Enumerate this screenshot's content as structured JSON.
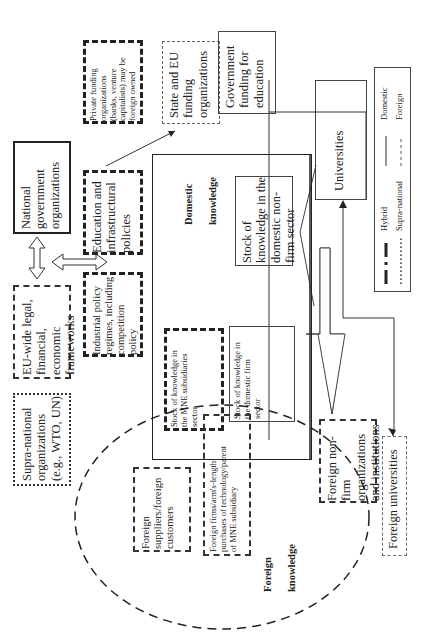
{
  "diagram": {
    "orientation": "rotated-90-ccw",
    "nodes": {
      "private_funding": "Private funding\norganizations\n(banks, venture\ncapitalists) may be\nforeign owned",
      "state_eu_funding": "State and EU\nfunding\norganizations",
      "gov_funding_education": "Government\nfunding for\neducation",
      "national_gov": "National\ngovernment\norganizations",
      "education_policies": "Education and\ninfrastructural\npolicies",
      "eu_frameworks": "EU-wide legal,\nfinancial,\neconomic\nframeworks",
      "industrial_policy": "Industrial policy\nregimes, including\ncompetition\npolicy",
      "supra_national": "Supra-national\norganizations\n(e.g., WTO, UN)",
      "domestic_knowledge_label": "Domestic\n\nknowledge",
      "stock_nonfirm": "Stock of\nknowledge in the\ndomestic non-\nfirm sector",
      "universities": "Universities",
      "stock_mne": "Stock of knowledge in\nthe MNE subsidiaries\nsector",
      "stock_domestic_firm": "Stock of knowledge in\nthe domestic firm\nsector",
      "foreign_suppliers": "Foreign\nsuppliers/foreign\ncustomers",
      "foreign_firms": "Foreign firms/arm's-length\npurchases of technology/parent\nof MNE subsidiary",
      "foreign_knowledge_label": "Foreign\n\nknowledge",
      "foreign_nonfirm": "Foreign non-\nfirm\norganizations\nand institutions",
      "foreign_universities": "Foreign universities"
    },
    "legend": {
      "items": [
        {
          "style": "hybrid",
          "label": "Hybrid"
        },
        {
          "style": "solid",
          "label": "Domestic"
        },
        {
          "style": "dotted",
          "label": "Supra-national"
        },
        {
          "style": "dashed",
          "label": "Foreign"
        }
      ]
    }
  }
}
